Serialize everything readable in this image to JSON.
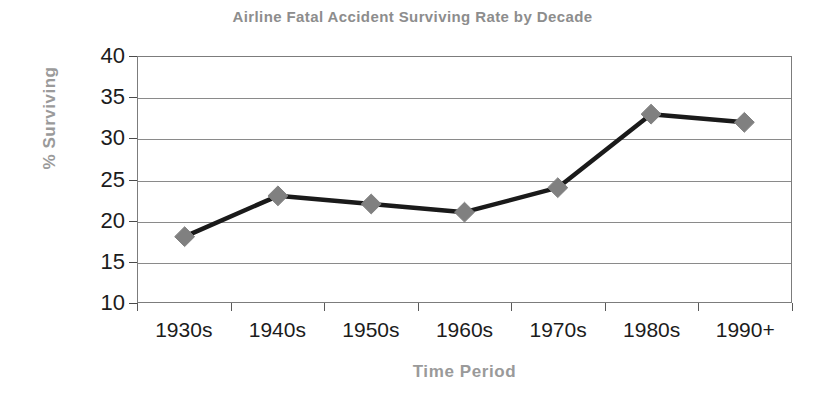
{
  "chart_data": {
    "type": "line",
    "title": "Airline Fatal Accident Surviving Rate by Decade",
    "xlabel": "Time Period",
    "ylabel": "% Surviving",
    "categories": [
      "1930s",
      "1940s",
      "1950s",
      "1960s",
      "1970s",
      "1980s",
      "1990+"
    ],
    "values": [
      18,
      23,
      22,
      21,
      24,
      33,
      32
    ],
    "series": [
      {
        "name": "% Surviving",
        "values": [
          18,
          23,
          22,
          21,
          24,
          33,
          32
        ]
      }
    ],
    "ylim": [
      10,
      40
    ],
    "yticks": [
      10,
      15,
      20,
      25,
      30,
      35,
      40
    ],
    "ytick_labels": [
      "10",
      "15",
      "20",
      "25",
      "30",
      "35",
      "40"
    ],
    "grid": true,
    "grid_axis": "y",
    "legend": false,
    "marker": "diamond",
    "marker_color": "#808080",
    "line_color": "#1a1a1a",
    "title_color": "#8d8d8d",
    "axis_title_color": "#9a9a9a",
    "tick_label_color": "#1c1c1c",
    "plot_border_color": "#7c7c7c",
    "gridline_color": "#8a8a8a",
    "background_color": "#ffffff"
  }
}
